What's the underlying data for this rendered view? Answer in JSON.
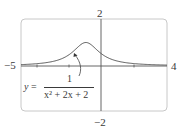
{
  "chart_data": {
    "type": "line",
    "title": "",
    "equation_label": {
      "lhs": "y",
      "equals": "=",
      "numerator": "1",
      "denominator": "x² + 2x + 2"
    },
    "function": "1/(x^2+2x+2)",
    "xlim": [
      -5,
      4
    ],
    "ylim": [
      -2,
      2
    ],
    "xlabel": "",
    "ylabel": "",
    "tick_labels": {
      "x_min": "−5",
      "x_max": "4",
      "y_max": "2",
      "y_min": "−2"
    },
    "x_ticks": [
      -4,
      -2,
      2
    ],
    "grid": false,
    "series": [
      {
        "name": "y = 1/(x^2+2x+2)",
        "x": [
          -5,
          -4,
          -3,
          -2,
          -1.5,
          -1,
          -0.5,
          0,
          1,
          2,
          3,
          4
        ],
        "values": [
          0.059,
          0.1,
          0.2,
          0.5,
          0.8,
          1.0,
          0.8,
          0.5,
          0.2,
          0.1,
          0.059,
          0.038
        ]
      }
    ],
    "annotations": [
      {
        "text": "y = 1/(x^2+2x+2)",
        "type": "arrow-label",
        "points_to_x": -1.7
      }
    ],
    "colors": {
      "curve": "#555555",
      "axes": "#555555",
      "frame": "#c8c8c8"
    }
  }
}
